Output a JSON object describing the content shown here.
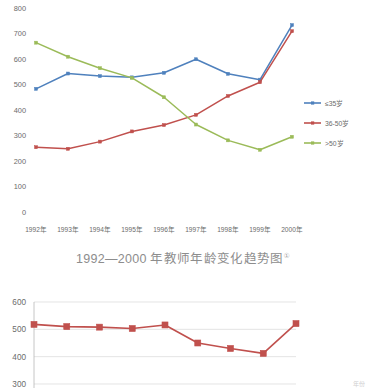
{
  "caption": {
    "text": "1992—2000 年教师年龄变化趋势图",
    "footnote_marker": "①"
  },
  "corner_note": "年份",
  "colors": {
    "series_1": "#4F81BD",
    "series_2": "#C0504D",
    "series_3": "#9BBB59",
    "gridline": "#d9d9d9",
    "axis": "#b8b8b8",
    "tick_text": "#6b6b6b",
    "caption_text": "#8d8d8d"
  },
  "chart_data": [
    {
      "type": "line",
      "title": "1992—2000 年教师年龄变化趋势图",
      "xlabel": "",
      "ylabel": "",
      "ylim": [
        0,
        800
      ],
      "ytick_step": 100,
      "yticks": [
        "800",
        "700",
        "600",
        "500",
        "400",
        "300",
        "200",
        "100",
        "0"
      ],
      "grid": false,
      "legend_position": "right",
      "categories": [
        "1992年",
        "1993年",
        "1994年",
        "1995年",
        "1996年",
        "1997年",
        "1998年",
        "1999年",
        "2000年"
      ],
      "series": [
        {
          "name": "≤35岁",
          "values": [
            483,
            543,
            533,
            528,
            546,
            599,
            542,
            519,
            733
          ]
        },
        {
          "name": "36-50岁",
          "values": [
            254,
            248,
            276,
            316,
            341,
            381,
            455,
            509,
            709
          ]
        },
        {
          "name": ">50岁",
          "values": [
            664,
            609,
            564,
            526,
            450,
            343,
            281,
            244,
            295
          ]
        }
      ]
    },
    {
      "type": "line",
      "title": "",
      "xlabel": "",
      "ylabel": "",
      "ylim": [
        300,
        600
      ],
      "ytick_step": 100,
      "yticks": [
        "600",
        "500",
        "400",
        "300"
      ],
      "grid": true,
      "legend_position": "none",
      "categories": [
        "1",
        "2",
        "3",
        "4",
        "5",
        "6",
        "7",
        "8",
        "9"
      ],
      "series": [
        {
          "name": "series-1",
          "values": [
            518,
            510,
            508,
            503,
            516,
            450,
            430,
            412,
            521
          ]
        }
      ]
    }
  ]
}
